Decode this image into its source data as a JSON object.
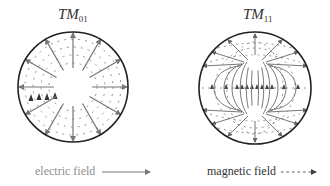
{
  "figure": {
    "panels": [
      {
        "id": "tm01",
        "title_main": "TM",
        "title_sub": "01",
        "center": [
          73,
          87
        ],
        "radius": 55,
        "inner_radius": 19,
        "electric_field_arrows": 12,
        "magnetic_field_rings": 4
      },
      {
        "id": "tm11",
        "title_main": "TM",
        "title_sub": "11",
        "center": [
          255,
          88
        ],
        "radius": 56
      }
    ],
    "legend": {
      "electric_label": "electric field",
      "electric_style": "solid arrow",
      "magnetic_label": "magnetic field",
      "magnetic_style": "dashed arrow"
    },
    "colors": {
      "boundary": "#222222",
      "electric": "#777777",
      "magnetic": "#555555",
      "background": "#ffffff"
    }
  }
}
